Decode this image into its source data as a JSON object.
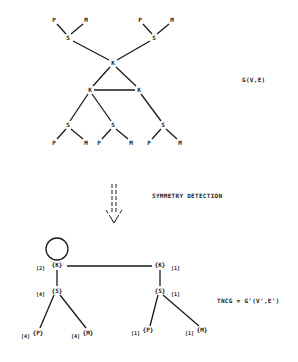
{
  "original_graph": {
    "label": "G(V,E)",
    "nodes": [
      {
        "id": "p1",
        "text": "P",
        "x": 54,
        "y": 20
      },
      {
        "id": "m1",
        "text": "M",
        "x": 86,
        "y": 20
      },
      {
        "id": "s1",
        "text": "S",
        "x": 68,
        "y": 38
      },
      {
        "id": "p2",
        "text": "P",
        "x": 140,
        "y": 20
      },
      {
        "id": "m2",
        "text": "M",
        "x": 172,
        "y": 20
      },
      {
        "id": "s2",
        "text": "S",
        "x": 154,
        "y": 38
      },
      {
        "id": "k1",
        "text": "K",
        "x": 113,
        "y": 63
      },
      {
        "id": "k2",
        "text": "K",
        "x": 90,
        "y": 90
      },
      {
        "id": "k3",
        "text": "K",
        "x": 139,
        "y": 90
      },
      {
        "id": "s3",
        "text": "S",
        "x": 68,
        "y": 125
      },
      {
        "id": "s4",
        "text": "S",
        "x": 113,
        "y": 125
      },
      {
        "id": "s5",
        "text": "S",
        "x": 163,
        "y": 125
      },
      {
        "id": "p3",
        "text": "P",
        "x": 54,
        "y": 143
      },
      {
        "id": "m3",
        "text": "M",
        "x": 86,
        "y": 143
      },
      {
        "id": "p4",
        "text": "P",
        "x": 99,
        "y": 143
      },
      {
        "id": "m4",
        "text": "M",
        "x": 131,
        "y": 143
      },
      {
        "id": "p5",
        "text": "P",
        "x": 149,
        "y": 143
      },
      {
        "id": "m5",
        "text": "M",
        "x": 180,
        "y": 143
      }
    ],
    "edges": [
      [
        "p1",
        "s1"
      ],
      [
        "m1",
        "s1"
      ],
      [
        "p2",
        "s2"
      ],
      [
        "m2",
        "s2"
      ],
      [
        "s1",
        "k1"
      ],
      [
        "s2",
        "k1"
      ],
      [
        "k1",
        "k2"
      ],
      [
        "k1",
        "k3"
      ],
      [
        "k2",
        "k3"
      ],
      [
        "k2",
        "s3"
      ],
      [
        "k2",
        "s4"
      ],
      [
        "k3",
        "s5"
      ],
      [
        "s3",
        "p3"
      ],
      [
        "s3",
        "m3"
      ],
      [
        "s4",
        "p4"
      ],
      [
        "s4",
        "m4"
      ],
      [
        "s5",
        "p5"
      ],
      [
        "s5",
        "m5"
      ]
    ]
  },
  "transform": {
    "label": "SYMMETRY DETECTION"
  },
  "quotient_graph": {
    "label": "TNCG = G'(V',E')",
    "nodes": [
      {
        "id": "qk1",
        "text": "{K}",
        "mult": "[2]",
        "mult_side": "left",
        "x": 57,
        "y": 265
      },
      {
        "id": "qs1",
        "text": "{S}",
        "mult": "[4]",
        "mult_side": "left",
        "x": 57,
        "y": 291
      },
      {
        "id": "qp1",
        "text": "{P}",
        "mult": "[4]",
        "mult_side": "left",
        "x": 38,
        "y": 333
      },
      {
        "id": "qm1",
        "text": "{M}",
        "mult": "[4]",
        "mult_side": "left",
        "x": 88,
        "y": 333
      },
      {
        "id": "qk2",
        "text": "{K}",
        "mult": "[1]",
        "mult_side": "right",
        "x": 160,
        "y": 265
      },
      {
        "id": "qs2",
        "text": "{S}",
        "mult": "[1]",
        "mult_side": "right",
        "x": 160,
        "y": 291
      },
      {
        "id": "qp2",
        "text": "{P}",
        "mult": "[1]",
        "mult_side": "left",
        "x": 148,
        "y": 333
      },
      {
        "id": "qm2",
        "text": "{M}",
        "mult": "[1]",
        "mult_side": "left",
        "x": 202,
        "y": 333
      }
    ],
    "edges": [
      [
        "qk1",
        "qk2"
      ],
      [
        "qk1",
        "qs1"
      ],
      [
        "qs1",
        "qp1"
      ],
      [
        "qs1",
        "qm1"
      ],
      [
        "qk2",
        "qs2"
      ],
      [
        "qs2",
        "qp2"
      ],
      [
        "qs2",
        "qm2"
      ]
    ],
    "self_loops": [
      "qk1"
    ]
  }
}
